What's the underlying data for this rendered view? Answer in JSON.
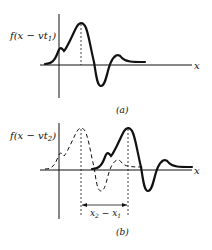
{
  "panel_a": {
    "ylabel_prefix": "f(x − vt",
    "ylabel_sub": "1",
    "ylabel_suffix": ")",
    "xlabel": "x",
    "caption": "(a)"
  },
  "panel_b": {
    "ylabel_prefix": "f(x − vt",
    "ylabel_sub": "2",
    "ylabel_suffix": ")",
    "xlabel": "x",
    "caption": "(b)",
    "displacement_label_a": "x",
    "displacement_sub_a": "2",
    "displacement_minus": " − ",
    "displacement_label_b": "x",
    "displacement_sub_b": "1"
  },
  "colors": {
    "ink": "#111111",
    "background": "#ffffff"
  }
}
